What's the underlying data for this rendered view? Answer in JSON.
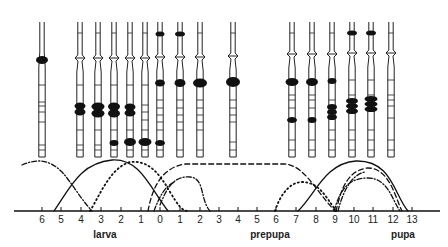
{
  "figure": {
    "type": "puffing-pattern-diagram",
    "axis": {
      "y": 211,
      "x_start": 14,
      "x_end": 440,
      "ticks": [
        {
          "label": "6",
          "x": 42
        },
        {
          "label": "5",
          "x": 61
        },
        {
          "label": "4",
          "x": 81
        },
        {
          "label": "3",
          "x": 101
        },
        {
          "label": "2",
          "x": 121
        },
        {
          "label": "1",
          "x": 141
        },
        {
          "label": "0",
          "x": 160
        },
        {
          "label": "1",
          "x": 180
        },
        {
          "label": "2",
          "x": 200
        },
        {
          "label": "3",
          "x": 219
        },
        {
          "label": "4",
          "x": 238
        },
        {
          "label": "5",
          "x": 257
        },
        {
          "label": "6",
          "x": 276
        },
        {
          "label": "7",
          "x": 296
        },
        {
          "label": "8",
          "x": 316
        },
        {
          "label": "9",
          "x": 335
        },
        {
          "label": "10",
          "x": 354
        },
        {
          "label": "11",
          "x": 373
        },
        {
          "label": "12",
          "x": 393
        },
        {
          "label": "13",
          "x": 412
        }
      ],
      "stage_labels": [
        {
          "text": "larva",
          "x": 105,
          "y": 238
        },
        {
          "text": "prepupa",
          "x": 270,
          "y": 238
        },
        {
          "text": "pupa",
          "x": 403,
          "y": 238
        }
      ]
    },
    "chromosomes": [
      {
        "x": 42,
        "top": 22,
        "bottom": 157,
        "constriction": false,
        "puffs": [
          {
            "y": 60,
            "w": 12,
            "h": 8,
            "n": 1
          }
        ],
        "bands": [
          85,
          102,
          106,
          112,
          122,
          145,
          150
        ]
      },
      {
        "x": 80,
        "top": 22,
        "bottom": 157,
        "constriction": true,
        "constr_y": 58,
        "puffs": [
          {
            "y": 109,
            "w": 11,
            "h": 7,
            "n": 2
          }
        ],
        "bands": [
          33,
          85,
          130,
          145,
          150
        ]
      },
      {
        "x": 98,
        "top": 22,
        "bottom": 157,
        "constriction": true,
        "constr_y": 58,
        "puffs": [
          {
            "y": 110,
            "w": 13,
            "h": 8,
            "n": 2
          }
        ],
        "bands": [
          33,
          85,
          130,
          145,
          150
        ]
      },
      {
        "x": 114,
        "top": 22,
        "bottom": 157,
        "constriction": true,
        "constr_y": 58,
        "puffs": [
          {
            "y": 110,
            "w": 12,
            "h": 8,
            "n": 2
          },
          {
            "y": 143,
            "w": 9,
            "h": 6,
            "n": 1
          }
        ],
        "bands": [
          33,
          85,
          130,
          150
        ]
      },
      {
        "x": 130,
        "top": 22,
        "bottom": 157,
        "constriction": true,
        "constr_y": 58,
        "puffs": [
          {
            "y": 110,
            "w": 11,
            "h": 7,
            "n": 2
          },
          {
            "y": 142,
            "w": 12,
            "h": 8,
            "n": 1
          }
        ],
        "bands": [
          33,
          85,
          130,
          150
        ]
      },
      {
        "x": 145,
        "top": 22,
        "bottom": 157,
        "constriction": true,
        "constr_y": 58,
        "puffs": [
          {
            "y": 142,
            "w": 13,
            "h": 8,
            "n": 1
          }
        ],
        "bands": [
          33,
          85,
          105,
          112,
          120,
          130,
          150
        ]
      },
      {
        "x": 160,
        "top": 22,
        "bottom": 157,
        "constriction": true,
        "constr_y": 57,
        "puffs": [
          {
            "y": 34,
            "w": 9,
            "h": 5,
            "n": 1
          },
          {
            "y": 83,
            "w": 10,
            "h": 7,
            "n": 1
          },
          {
            "y": 143,
            "w": 10,
            "h": 6,
            "n": 1
          }
        ],
        "bands": [
          100,
          108,
          115,
          122,
          130,
          150
        ]
      },
      {
        "x": 180,
        "top": 22,
        "bottom": 157,
        "constriction": true,
        "constr_y": 57,
        "puffs": [
          {
            "y": 34,
            "w": 10,
            "h": 5,
            "n": 1
          },
          {
            "y": 83,
            "w": 11,
            "h": 8,
            "n": 1
          }
        ],
        "bands": [
          100,
          108,
          115,
          122,
          130,
          150
        ]
      },
      {
        "x": 200,
        "top": 22,
        "bottom": 157,
        "constriction": true,
        "constr_y": 57,
        "puffs": [
          {
            "y": 83,
            "w": 14,
            "h": 9,
            "n": 1
          }
        ],
        "bands": [
          33,
          100,
          108,
          115,
          122,
          130,
          150
        ]
      },
      {
        "x": 233,
        "top": 22,
        "bottom": 157,
        "constriction": true,
        "constr_y": 56,
        "puffs": [
          {
            "y": 82,
            "w": 14,
            "h": 10,
            "n": 1
          }
        ],
        "bands": [
          33,
          100,
          108,
          115,
          122,
          142,
          150
        ]
      },
      {
        "x": 292,
        "top": 22,
        "bottom": 157,
        "constriction": true,
        "constr_y": 54,
        "puffs": [
          {
            "y": 82,
            "w": 13,
            "h": 8,
            "n": 1
          },
          {
            "y": 120,
            "w": 10,
            "h": 6,
            "n": 1
          }
        ],
        "bands": [
          33,
          95,
          100,
          108,
          140,
          150
        ]
      },
      {
        "x": 312,
        "top": 22,
        "bottom": 157,
        "constriction": true,
        "constr_y": 54,
        "puffs": [
          {
            "y": 82,
            "w": 12,
            "h": 8,
            "n": 1
          },
          {
            "y": 120,
            "w": 9,
            "h": 6,
            "n": 1
          }
        ],
        "bands": [
          33,
          95,
          100,
          108,
          140,
          150
        ]
      },
      {
        "x": 332,
        "top": 22,
        "bottom": 157,
        "constriction": true,
        "constr_y": 54,
        "puffs": [
          {
            "y": 81,
            "w": 9,
            "h": 6,
            "n": 1
          },
          {
            "y": 112,
            "w": 10,
            "h": 6,
            "n": 3
          }
        ],
        "bands": [
          33,
          100,
          130,
          140,
          150
        ]
      },
      {
        "x": 352,
        "top": 22,
        "bottom": 157,
        "constriction": true,
        "constr_y": 53,
        "puffs": [
          {
            "y": 33,
            "w": 10,
            "h": 5,
            "n": 1
          },
          {
            "y": 106,
            "w": 12,
            "h": 6,
            "n": 3
          }
        ],
        "bands": [
          80,
          95,
          130,
          140,
          150
        ]
      },
      {
        "x": 371,
        "top": 22,
        "bottom": 157,
        "constriction": true,
        "constr_y": 53,
        "puffs": [
          {
            "y": 33,
            "w": 10,
            "h": 5,
            "n": 1
          },
          {
            "y": 104,
            "w": 13,
            "h": 6,
            "n": 3
          }
        ],
        "bands": [
          80,
          95,
          130,
          140,
          150
        ]
      },
      {
        "x": 391,
        "top": 22,
        "bottom": 157,
        "constriction": true,
        "constr_y": 53,
        "puffs": [],
        "bands": [
          33,
          80,
          95,
          100,
          106,
          118,
          140,
          150
        ]
      }
    ],
    "curves": [
      {
        "name": "dash-dot-curve-larval-early",
        "style": "dashdot",
        "d": "M22,165 C38,158 50,160 62,172 C72,183 80,198 92,211"
      },
      {
        "name": "solid-curve-larval",
        "style": "solid",
        "d": "M54,211 C70,188 80,163 112,160 C140,158 150,188 168,211"
      },
      {
        "name": "dotted-curve-larval",
        "style": "dotted",
        "d": "M90,211 C100,195 110,168 130,162 C150,160 160,175 170,192 C178,205 182,211 188,211"
      },
      {
        "name": "dashed-curve-long",
        "style": "dashed",
        "d": "M148,211 C152,190 160,168 185,164 L285,164 C305,166 315,190 335,211"
      },
      {
        "name": "dash-dot-curve-prepupal",
        "style": "dashdot",
        "d": "M160,205 C168,185 175,176 190,177 C205,178 200,200 210,211"
      },
      {
        "name": "dashdot-curve-prepupal-2",
        "style": "dashdot",
        "d": "M154,211 C160,195 166,185 175,182"
      },
      {
        "name": "dotted-curve-prepupal",
        "style": "dotted",
        "d": "M275,211 C280,195 290,182 302,182 C318,182 325,195 336,211"
      },
      {
        "name": "solid-curve-pupal",
        "style": "solid",
        "d": "M298,211 C315,195 325,163 356,161 C392,160 394,195 408,211"
      },
      {
        "name": "dashed-curve-pupal",
        "style": "dashed",
        "d": "M336,211 C340,195 345,170 368,168 C390,168 396,200 402,211"
      },
      {
        "name": "dash-dot-curve-pupal",
        "style": "dashdot",
        "d": "M334,211 C340,190 348,178 368,178 C388,178 392,200 400,211"
      },
      {
        "name": "dotted-curve-pupal-2",
        "style": "dashdot",
        "d": "M338,211 C342,195 350,175 365,172"
      }
    ]
  }
}
